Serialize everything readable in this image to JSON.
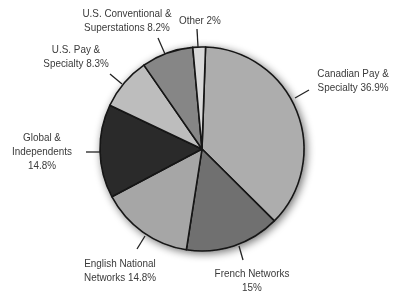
{
  "chart_data": {
    "type": "pie",
    "title": "",
    "start_angle_deg": 2,
    "direction": "clockwise",
    "center": [
      202,
      149
    ],
    "radius": 102,
    "slices": [
      {
        "name": "Canadian Pay & Specialty",
        "value": 36.9,
        "color": "#adadad",
        "label_lines": [
          "Canadian Pay &",
          "Specialty 36.9%"
        ]
      },
      {
        "name": "French Networks",
        "value": 15,
        "color": "#6f6f6f",
        "label_lines": [
          "French Networks",
          "15%"
        ]
      },
      {
        "name": "English National Networks",
        "value": 14.8,
        "color": "#a6a6a6",
        "label_lines": [
          "English National",
          "Networks 14.8%"
        ]
      },
      {
        "name": "Global & Independents",
        "value": 14.8,
        "color": "#2b2b2b",
        "label_lines": [
          "Global &",
          "Independents",
          "14.8%"
        ]
      },
      {
        "name": "U.S. Pay & Specialty",
        "value": 8.3,
        "color": "#bdbdbd",
        "label_lines": [
          "U.S. Pay &",
          "Specialty 8.3%"
        ]
      },
      {
        "name": "U.S. Conventional & Superstations",
        "value": 8.2,
        "color": "#868686",
        "label_lines": [
          "U.S. Conventional &",
          "Superstations 8.2%"
        ]
      },
      {
        "name": "Other",
        "value": 2,
        "color": "#d9d9d9",
        "label_lines": [
          "Other 2%"
        ]
      }
    ],
    "legend": "none (direct labels with leader lines)"
  },
  "labels": {
    "canadian": {
      "line1": "Canadian Pay &",
      "line2": "Specialty 36.9%"
    },
    "french": {
      "line1": "French Networks",
      "line2": "15%"
    },
    "english": {
      "line1": "English National",
      "line2": "Networks 14.8%"
    },
    "global": {
      "line1": "Global &",
      "line2": "Independents",
      "line3": "14.8%"
    },
    "uspay": {
      "line1": "U.S. Pay &",
      "line2": "Specialty 8.3%"
    },
    "usconv": {
      "line1": "U.S. Conventional &",
      "line2": "Superstations 8.2%"
    },
    "other": {
      "line1": "Other 2%"
    }
  }
}
